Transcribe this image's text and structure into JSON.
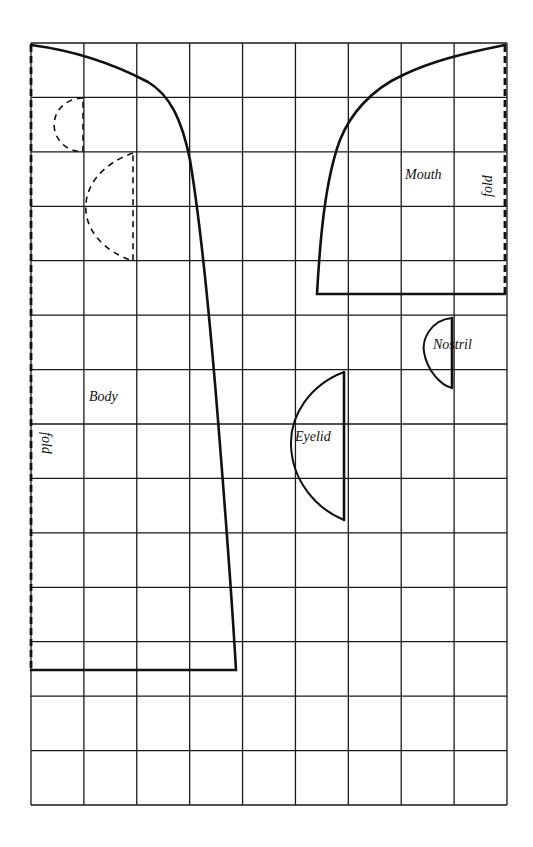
{
  "diagram": {
    "type": "sewing-pattern-grid",
    "grid": {
      "columns": 9,
      "rows": 14,
      "left": 31,
      "top": 43,
      "right": 507,
      "bottom": 805,
      "line_color": "#1a1a1a"
    },
    "pieces": [
      {
        "id": "body",
        "label": "Body",
        "fold_label": "fold"
      },
      {
        "id": "mouth",
        "label": "Mouth",
        "fold_label": "fold"
      },
      {
        "id": "eyelid",
        "label": "Eyelid"
      },
      {
        "id": "nostril",
        "label": "Nostril"
      }
    ],
    "labels": {
      "body": "Body",
      "body_fold": "fold",
      "mouth": "Mouth",
      "mouth_fold": "fold",
      "eyelid": "Eyelid",
      "nostril": "Nostril"
    },
    "colors": {
      "ink": "#111111",
      "paper": "#ffffff"
    }
  }
}
